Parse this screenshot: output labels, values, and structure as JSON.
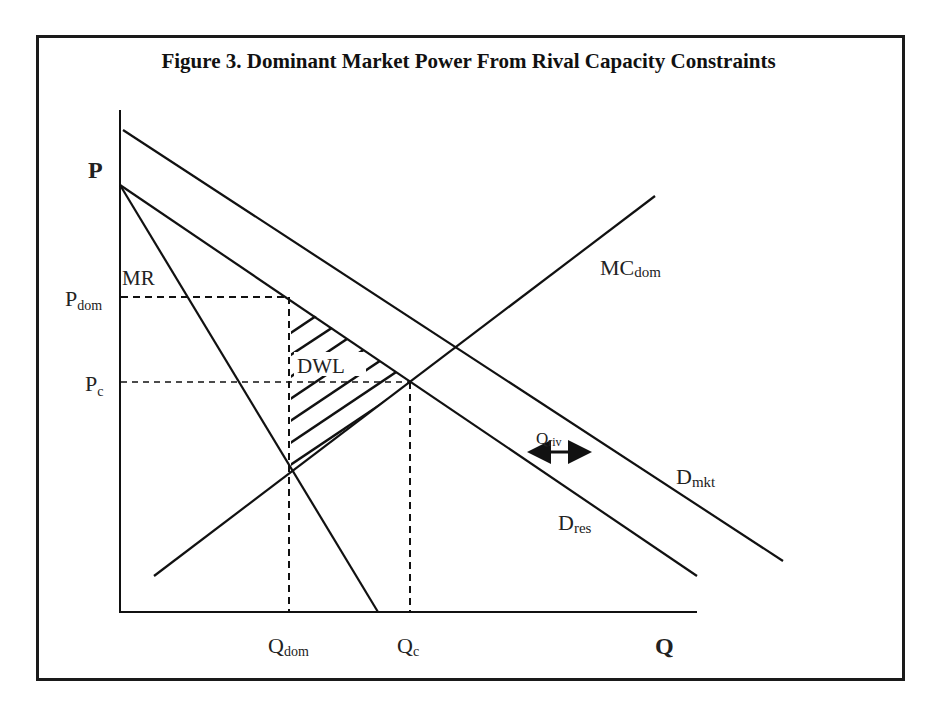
{
  "title": "Figure 3. Dominant Market Power From Rival Capacity Constraints",
  "axes": {
    "y_label": "P",
    "x_label": "Q"
  },
  "labels": {
    "p_dom": {
      "main": "P",
      "sub": "dom"
    },
    "p_c": {
      "main": "P",
      "sub": "c"
    },
    "q_dom": {
      "main": "Q",
      "sub": "dom"
    },
    "q_c": {
      "main": "Q",
      "sub": "c"
    },
    "mr": "MR",
    "mc_dom": {
      "main": "MC",
      "sub": "dom"
    },
    "d_mkt": {
      "main": "D",
      "sub": "mkt"
    },
    "d_res": {
      "main": "D",
      "sub": "res"
    },
    "q_riv": {
      "main": "Q",
      "sub": "riv"
    },
    "dwl": "DWL"
  },
  "curves": [
    {
      "name": "D_mkt",
      "type": "line",
      "from": [
        123,
        130
      ],
      "to": [
        783,
        561
      ]
    },
    {
      "name": "D_res",
      "type": "line",
      "from": [
        120,
        185
      ],
      "to": [
        697,
        576
      ]
    },
    {
      "name": "MR",
      "type": "line",
      "from": [
        120,
        185
      ],
      "to": [
        378,
        612
      ]
    },
    {
      "name": "MC_dom",
      "type": "line",
      "from": [
        154,
        576
      ],
      "to": [
        655,
        196
      ]
    }
  ],
  "reference_lines": [
    {
      "name": "P_dom",
      "orientation": "horizontal",
      "y": 297,
      "x_from": 120,
      "x_to": 289
    },
    {
      "name": "P_c",
      "orientation": "horizontal",
      "y": 382,
      "x_from": 120,
      "x_to": 410
    },
    {
      "name": "Q_dom",
      "orientation": "vertical",
      "x": 289,
      "y_from": 297,
      "y_to": 612
    },
    {
      "name": "Q_c",
      "orientation": "vertical",
      "x": 410,
      "y_from": 382,
      "y_to": 612
    }
  ],
  "annotations": {
    "dwl_region": "Hatched triangle between P_dom/D_res, Q_dom and MC_dom",
    "q_riv_arrow": "Double-headed arrow showing horizontal gap between D_res and D_mkt"
  }
}
